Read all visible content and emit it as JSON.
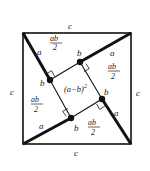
{
  "outer_square": {
    "side_label": "c",
    "x0": 23,
    "y0": 33,
    "x1": 131,
    "y1": 144
  },
  "inner_square": {
    "label_base": "(a−b)",
    "label_exp": "2",
    "vertices": [
      [
        80,
        62
      ],
      [
        102,
        99
      ],
      [
        71,
        118
      ],
      [
        50,
        80
      ]
    ]
  },
  "triangle_area_label": {
    "num": "ab",
    "den": "2"
  },
  "side_labels": {
    "c": "c",
    "a": "a",
    "b": "b"
  },
  "colors": {
    "line": "#111111",
    "text": "#222222",
    "background": "#ffffff"
  }
}
